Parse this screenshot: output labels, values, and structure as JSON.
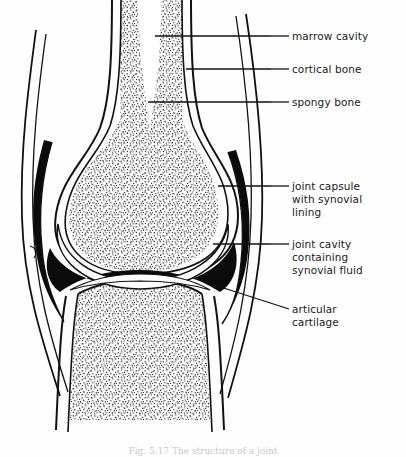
{
  "figure": {
    "title_alt": "Diagram of a synovial joint in longitudinal section",
    "caption": "Fig. 5.17 The structure of a joint",
    "ink_color": "#111111",
    "paper_color": "#ffffff",
    "stipple_color": "#2b2b2b"
  },
  "labels": [
    {
      "id": "marrow-cavity",
      "text": "marrow cavity",
      "x": 292,
      "y": 30,
      "leader": {
        "x1": 271,
        "y1": 36,
        "x2": 289,
        "y2": 36
      }
    },
    {
      "id": "cortical-bone",
      "text": "cortical bone",
      "x": 292,
      "y": 63,
      "leader": {
        "x1": 271,
        "y1": 69,
        "x2": 289,
        "y2": 69
      }
    },
    {
      "id": "spongy-bone",
      "text": "spongy bone",
      "x": 292,
      "y": 96,
      "leader": {
        "x1": 271,
        "y1": 102,
        "x2": 289,
        "y2": 102
      }
    },
    {
      "id": "joint-capsule",
      "text": "joint capsule\nwith synovial\nlining",
      "x": 292,
      "y": 180,
      "leader": {
        "x1": 271,
        "y1": 186,
        "x2": 289,
        "y2": 186
      }
    },
    {
      "id": "joint-cavity",
      "text": "joint cavity\ncontaining\nsynovial fluid",
      "x": 292,
      "y": 238,
      "leader": {
        "x1": 271,
        "y1": 244,
        "x2": 289,
        "y2": 244
      }
    },
    {
      "id": "articular-cartilage",
      "text": "articular\ncartilage",
      "x": 292,
      "y": 303,
      "leader": {
        "x1": 205,
        "y1": 282,
        "x2": 289,
        "y2": 309
      }
    }
  ],
  "leader_lines_long": [
    {
      "id": "leader-marrow-cavity",
      "x1": 155,
      "y1": 36,
      "x2": 271,
      "y2": 36
    },
    {
      "id": "leader-cortical-bone",
      "x1": 186,
      "y1": 69,
      "x2": 271,
      "y2": 69
    },
    {
      "id": "leader-spongy-bone",
      "x1": 148,
      "y1": 102,
      "x2": 271,
      "y2": 102
    },
    {
      "id": "leader-joint-capsule",
      "x1": 218,
      "y1": 186,
      "x2": 271,
      "y2": 186
    },
    {
      "id": "leader-joint-cavity",
      "x1": 213,
      "y1": 244,
      "x2": 271,
      "y2": 244
    }
  ],
  "anatomy": {
    "upper_bone": "femur-like upper bone with flared condyle head",
    "lower_bone": "tibia-like lower bone with flared plateau",
    "capsule": "thick black band enclosing the joint",
    "cavity": "black wedge between the two articular surfaces",
    "cartilage": "white band capping each bone end"
  }
}
